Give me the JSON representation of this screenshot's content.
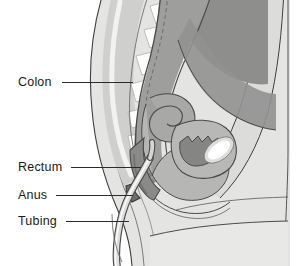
{
  "figure": {
    "type": "medical-illustration",
    "style": "grayscale line drawing",
    "background_color": "#ffffff",
    "palette": {
      "outline": "#3a3a3a",
      "skin_light": "#e2e2e0",
      "tissue_mid": "#c9c9c7",
      "tissue_dark": "#9b9b99",
      "organ_dark": "#8c8c8c",
      "organ_darkest": "#7a7a7a",
      "bone_white": "#ffffff",
      "tube_fill": "#dcdcda",
      "leader_line": "#2b2b2b",
      "label_text": "#1a1a1a"
    }
  },
  "labels": [
    {
      "text": "Colon",
      "x": 18,
      "y": 76,
      "leader_from": 62,
      "leader_to": 133,
      "leader_y": 82
    },
    {
      "text": "Rectum",
      "x": 18,
      "y": 161,
      "leader_from": 71,
      "leader_to": 141,
      "leader_y": 167
    },
    {
      "text": "Anus",
      "x": 18,
      "y": 189,
      "leader_from": 56,
      "leader_to": 133,
      "leader_y": 195
    },
    {
      "text": "Tubing",
      "x": 18,
      "y": 215,
      "leader_from": 66,
      "leader_to": 129,
      "leader_y": 221
    }
  ],
  "structures": [
    {
      "name": "sacrum-vertebrae",
      "description": "stacked white vertebral bodies along the lower spine"
    },
    {
      "name": "colon",
      "description": "dark gray descending colon curving down the posterior pelvis"
    },
    {
      "name": "rectum",
      "description": "dark gray terminal bowel segment above the anus"
    },
    {
      "name": "anus",
      "description": "anal canal opening at the base of the rectum"
    },
    {
      "name": "tubing",
      "description": "light curved tube inserted through the anus and running out below"
    },
    {
      "name": "uterus",
      "description": "mid-gray organ anterior to the rectum"
    },
    {
      "name": "bladder",
      "description": "gray pouch anterior to the uterus"
    },
    {
      "name": "pubic-bone",
      "description": "white elongated oval at the anterior pelvis"
    },
    {
      "name": "abdominal-wall",
      "description": "light tissue band along the right anterior body outline"
    },
    {
      "name": "thigh",
      "description": "light tissue band across the lower right"
    }
  ]
}
